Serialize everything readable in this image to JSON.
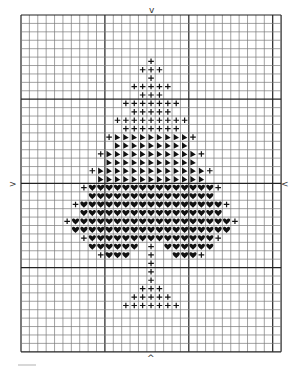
{
  "pattern": {
    "title": "Cross-stitch chart: spade-shaped tree",
    "grid": {
      "cols": 31,
      "rows": 40,
      "bold_every": 10,
      "left": 21,
      "top": 15,
      "cell_w": 8.39,
      "cell_h": 8.42,
      "line_color": "#7a7a7a",
      "bold_color": "#222222"
    },
    "center_markers": {
      "top": {
        "symbol": "v",
        "x": 152,
        "y": 6
      },
      "bottom": {
        "symbol": "^",
        "x": 150,
        "y": 354
      },
      "left": {
        "symbol": ">",
        "x": 12,
        "y": 180
      },
      "right": {
        "symbol": "<",
        "x": 284,
        "y": 180
      }
    },
    "legend": [
      {
        "symbol": "+",
        "name": "cross"
      },
      {
        "symbol": "triangle-right",
        "name": "half-triangle"
      },
      {
        "symbol": "heart",
        "name": "heart"
      }
    ]
  },
  "chart_data": {
    "type": "table",
    "title": "",
    "cols": 31,
    "rows": 40,
    "cells": [
      {
        "row": 5,
        "segments": [
          [
            "+",
            15,
            15
          ]
        ]
      },
      {
        "row": 6,
        "segments": [
          [
            "+",
            14,
            16
          ]
        ]
      },
      {
        "row": 7,
        "segments": [
          [
            "+",
            15,
            15
          ]
        ]
      },
      {
        "row": 8,
        "segments": [
          [
            "+",
            13,
            17
          ]
        ]
      },
      {
        "row": 9,
        "segments": [
          [
            "+",
            14,
            16
          ]
        ]
      },
      {
        "row": 10,
        "segments": [
          [
            "+",
            12,
            18
          ]
        ]
      },
      {
        "row": 11,
        "segments": [
          [
            "+",
            13,
            17
          ]
        ]
      },
      {
        "row": 12,
        "segments": [
          [
            "+",
            11,
            19
          ]
        ]
      },
      {
        "row": 13,
        "segments": [
          [
            "+",
            12,
            18
          ]
        ]
      },
      {
        "row": 14,
        "segments": [
          [
            "+",
            10,
            10
          ],
          [
            "T",
            11,
            19
          ],
          [
            "+",
            20,
            20
          ]
        ]
      },
      {
        "row": 15,
        "segments": [
          [
            "T",
            11,
            19
          ]
        ]
      },
      {
        "row": 16,
        "segments": [
          [
            "+",
            9,
            9
          ],
          [
            "T",
            10,
            20
          ],
          [
            "+",
            21,
            21
          ]
        ]
      },
      {
        "row": 17,
        "segments": [
          [
            "T",
            10,
            20
          ]
        ]
      },
      {
        "row": 18,
        "segments": [
          [
            "+",
            8,
            8
          ],
          [
            "T",
            9,
            21
          ],
          [
            "+",
            22,
            22
          ]
        ]
      },
      {
        "row": 19,
        "segments": [
          [
            "T",
            9,
            21
          ]
        ]
      },
      {
        "row": 20,
        "segments": [
          [
            "+",
            7,
            7
          ],
          [
            "H",
            8,
            22
          ],
          [
            "+",
            23,
            23
          ]
        ]
      },
      {
        "row": 21,
        "segments": [
          [
            "H",
            8,
            22
          ]
        ]
      },
      {
        "row": 22,
        "segments": [
          [
            "+",
            6,
            6
          ],
          [
            "H",
            7,
            23
          ],
          [
            "+",
            24,
            24
          ]
        ]
      },
      {
        "row": 23,
        "segments": [
          [
            "H",
            7,
            23
          ]
        ]
      },
      {
        "row": 24,
        "segments": [
          [
            "+",
            5,
            5
          ],
          [
            "H",
            6,
            24
          ],
          [
            "+",
            25,
            25
          ]
        ]
      },
      {
        "row": 25,
        "segments": [
          [
            "H",
            6,
            24
          ]
        ]
      },
      {
        "row": 26,
        "segments": [
          [
            "+",
            7,
            7
          ],
          [
            "H",
            8,
            22
          ],
          [
            "+",
            23,
            23
          ]
        ]
      },
      {
        "row": 27,
        "segments": [
          [
            "H",
            8,
            13
          ],
          [
            "+",
            15,
            15
          ],
          [
            "H",
            17,
            22
          ]
        ]
      },
      {
        "row": 28,
        "segments": [
          [
            "+",
            9,
            9
          ],
          [
            "H",
            10,
            12
          ],
          [
            "+",
            15,
            15
          ],
          [
            "H",
            18,
            20
          ],
          [
            "+",
            21,
            21
          ]
        ]
      },
      {
        "row": 29,
        "segments": [
          [
            "+",
            15,
            15
          ]
        ]
      },
      {
        "row": 30,
        "segments": [
          [
            "+",
            15,
            15
          ]
        ]
      },
      {
        "row": 31,
        "segments": [
          [
            "+",
            15,
            15
          ]
        ]
      },
      {
        "row": 32,
        "segments": [
          [
            "+",
            14,
            16
          ]
        ]
      },
      {
        "row": 33,
        "segments": [
          [
            "+",
            13,
            17
          ]
        ]
      },
      {
        "row": 34,
        "segments": [
          [
            "+",
            12,
            18
          ]
        ]
      }
    ],
    "symbol_key": {
      "+": "cross",
      "T": "half-triangle",
      "H": "heart"
    }
  }
}
